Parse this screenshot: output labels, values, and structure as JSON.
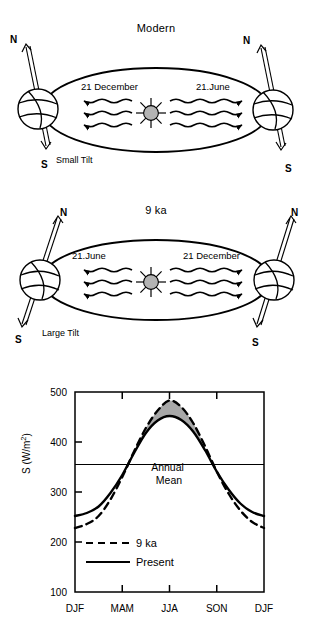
{
  "figure": {
    "panels": [
      {
        "id": "modern",
        "title": "Modern",
        "tilt_label": "Small Tilt",
        "left_season": "21 December",
        "right_season": "21.June",
        "left_north": "N",
        "left_south": "S",
        "right_north": "N",
        "right_south": "S"
      },
      {
        "id": "nine-ka",
        "title": "9 ka",
        "tilt_label": "Large Tilt",
        "left_season": "21.June",
        "right_season": "21 December",
        "left_north": "N",
        "left_south": "S",
        "right_north": "N",
        "right_south": "S"
      }
    ]
  },
  "chart_data": {
    "type": "line",
    "title": "",
    "xlabel": "",
    "ylabel": "S (W/m2)",
    "ylabel_display": "S (W/m",
    "ylabel_exponent": "2",
    "ylabel_close": ")",
    "categories": [
      "DJF",
      "MAM",
      "JJA",
      "SON",
      "DJF"
    ],
    "xticks": [
      "DJF",
      "MAM",
      "JJA",
      "SON",
      "DJF"
    ],
    "yticks": [
      "500",
      "400",
      "300",
      "200",
      "100"
    ],
    "ylim": [
      100,
      500
    ],
    "xlim": [
      0,
      4
    ],
    "grid": false,
    "legend_position": "inside-lower-left",
    "annotations": [
      {
        "name": "annual-mean",
        "text_line1": "Annual",
        "text_line2": "Mean",
        "value": 355
      }
    ],
    "shaded_region": {
      "label": "9 ka minus Present summer excess",
      "color": "#a8a8a8",
      "between": [
        "Present",
        "9 ka"
      ]
    },
    "series": [
      {
        "name": "9 ka",
        "style": "dashed",
        "color": "#000000",
        "x": [
          0,
          0.25,
          0.5,
          0.75,
          1,
          1.25,
          1.5,
          1.75,
          2,
          2.25,
          2.5,
          2.75,
          3,
          3.25,
          3.5,
          3.75,
          4
        ],
        "values": [
          228,
          236,
          252,
          285,
          330,
          381,
          428,
          463,
          483,
          470,
          438,
          392,
          341,
          297,
          263,
          240,
          228
        ]
      },
      {
        "name": "Present",
        "style": "solid",
        "color": "#000000",
        "x": [
          0,
          0.25,
          0.5,
          0.75,
          1,
          1.25,
          1.5,
          1.75,
          2,
          2.25,
          2.5,
          2.75,
          3,
          3.25,
          3.5,
          3.75,
          4
        ],
        "values": [
          252,
          258,
          271,
          298,
          334,
          378,
          418,
          443,
          452,
          444,
          421,
          384,
          341,
          305,
          277,
          260,
          252
        ]
      }
    ],
    "legend": [
      {
        "label": "9 ka",
        "style": "dashed"
      },
      {
        "label": "Present",
        "style": "solid"
      }
    ]
  }
}
